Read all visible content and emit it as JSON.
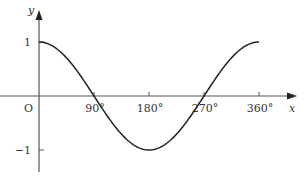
{
  "chart_data": {
    "type": "line",
    "title": "",
    "function": "y = cos x",
    "xlabel": "x",
    "ylabel": "y",
    "origin_label": "O",
    "x_ticks": [
      {
        "value": 90,
        "label": "90°"
      },
      {
        "value": 180,
        "label": "180°"
      },
      {
        "value": 270,
        "label": "270°"
      },
      {
        "value": 360,
        "label": "360°"
      }
    ],
    "y_ticks": [
      {
        "value": 1,
        "label": "1"
      },
      {
        "value": -1,
        "label": "-1"
      }
    ],
    "x": [
      0,
      30,
      60,
      90,
      120,
      150,
      180,
      210,
      240,
      270,
      300,
      330,
      360
    ],
    "values": [
      1,
      0.866,
      0.5,
      0,
      -0.5,
      -0.866,
      -1,
      -0.866,
      -0.5,
      0,
      0.5,
      0.866,
      1
    ],
    "xlim": [
      0,
      360
    ],
    "ylim": [
      -1,
      1
    ],
    "grid": false,
    "legend": null
  },
  "colors": {
    "axis": "#555555",
    "curve": "#222222",
    "text": "#333333"
  }
}
